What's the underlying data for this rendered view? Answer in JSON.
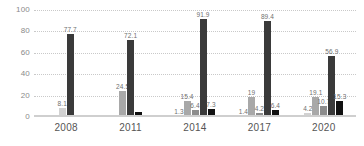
{
  "chart_data": {
    "type": "bar",
    "title": "",
    "xlabel": "",
    "ylabel": "",
    "categories": [
      "2008",
      "2011",
      "2014",
      "2017",
      "2020"
    ],
    "ylim": [
      0,
      100
    ],
    "yticks": [
      0,
      20,
      40,
      60,
      80,
      100
    ],
    "grid": true,
    "legend": "none",
    "series": [
      {
        "name": "Series 1",
        "color": "#d2d2d2",
        "values": [
          8.1,
          null,
          1.3,
          1.4,
          4.2
        ],
        "labels": [
          "8.1",
          "",
          "1.3",
          "1.4",
          "4.2"
        ]
      },
      {
        "name": "Series 2",
        "color": "#a8a8a8",
        "values": [
          null,
          24.5,
          15.4,
          19.0,
          19.1
        ],
        "labels": [
          "",
          "24.5",
          "15.4",
          "19",
          "19.1"
        ]
      },
      {
        "name": "Series 3",
        "color": "#8c8c8c",
        "values": [
          null,
          null,
          6.4,
          4.2,
          10.7
        ],
        "labels": [
          "",
          "",
          "6.4",
          "4.2",
          "10.7"
        ]
      },
      {
        "name": "Series 4",
        "color": "#3a3a3a",
        "values": [
          77.7,
          72.1,
          91.9,
          89.4,
          56.9
        ],
        "labels": [
          "77.7",
          "72.1",
          "91.9",
          "89.4",
          "56.9"
        ]
      },
      {
        "name": "Series 5",
        "color": "#111111",
        "values": [
          null,
          4.3,
          7.3,
          6.4,
          15.3
        ],
        "labels": [
          "",
          "",
          "7.3",
          "6.4",
          "15.3"
        ]
      }
    ]
  },
  "colors": {
    "gridline": "#c9c9c9",
    "baseline": "#cfcfcf",
    "tick_text": "#8a8a8a",
    "label_text": "#6f6f6f",
    "category_text": "#555555",
    "background": "#ffffff"
  }
}
